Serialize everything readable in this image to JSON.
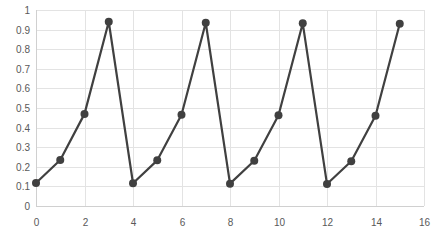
{
  "chart_data": {
    "type": "scatter",
    "title": "",
    "xlabel": "",
    "ylabel": "",
    "xlim": [
      0,
      16
    ],
    "ylim": [
      0,
      1
    ],
    "x_ticks": [
      0,
      2,
      4,
      6,
      8,
      10,
      12,
      14,
      16
    ],
    "y_ticks": [
      0,
      0.1,
      0.2,
      0.3,
      0.4,
      0.5,
      0.6,
      0.7,
      0.8,
      0.9,
      1
    ],
    "grid": true,
    "legend": null,
    "series": [
      {
        "name": "Series1",
        "x": [
          0,
          1,
          2,
          3,
          4,
          5,
          6,
          7,
          8,
          9,
          10,
          11,
          12,
          13,
          14,
          15
        ],
        "values": [
          0.117,
          0.235,
          0.47,
          0.94,
          0.116,
          0.233,
          0.466,
          0.935,
          0.114,
          0.231,
          0.463,
          0.932,
          0.112,
          0.228,
          0.46,
          0.93
        ],
        "color": "#404040",
        "marker": "circle",
        "line": true
      }
    ]
  },
  "colors": {
    "grid": "#e3e3e3",
    "axis_text": "#595959",
    "series": "#404040"
  }
}
